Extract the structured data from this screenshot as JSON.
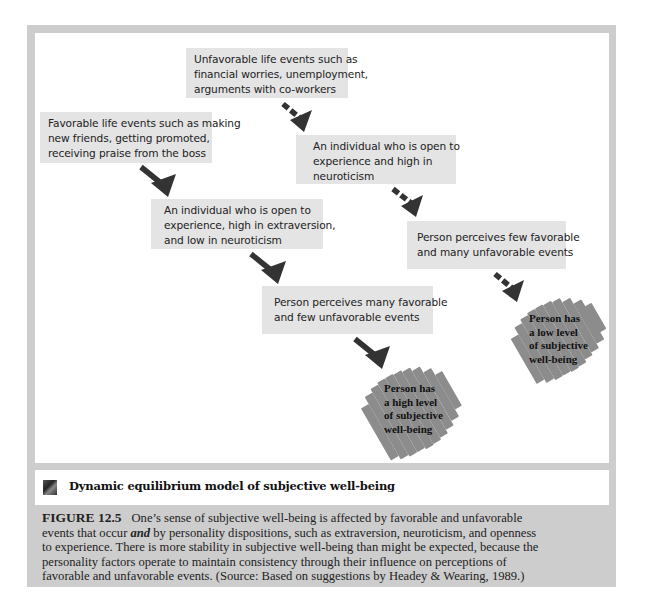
{
  "figure": {
    "title": "Dynamic equilibrium model of subjective well-being",
    "title_icon": "figure-icon",
    "caption_label": "FIGURE 12.5",
    "caption_lines": [
      "One’s sense of subjective well-being is affected by favorable and unfavorable",
      [
        "events that occur ",
        "and",
        " by personality dispositions, such as extraversion, neuroticism, and openness"
      ],
      "to experience. There is more stability in subjective well-being than might be expected, because the",
      "personality factors operate to maintain consistency through their influence on perceptions of",
      "favorable and unfavorable events.  (Source: Based on suggestions by Headey & Wearing, 1989.)"
    ],
    "caption_line2_pre": "events that occur ",
    "caption_line2_em": "and",
    "caption_line2_post": " by personality dispositions, such as extraversion, neuroticism, and openness"
  },
  "diagram": {
    "colors": {
      "box_fill": "#e4e4e4",
      "frame": "#cdcdcd",
      "arrow": "#333333",
      "splash": "#8c8c8c"
    },
    "nodes": {
      "unfavorable_events": {
        "lines": [
          "Unfavorable life events such as",
          "financial worries, unemployment,",
          "arguments with co-workers"
        ]
      },
      "favorable_events": {
        "lines": [
          "Favorable life events such as making",
          "new friends, getting promoted,",
          "receiving praise from the boss"
        ]
      },
      "open_high_neuroticism": {
        "lines": [
          "An individual who is open to",
          "experience and high in",
          "neuroticism"
        ]
      },
      "open_extraverted_low_neuroticism": {
        "lines": [
          "An individual who is open to",
          "experience, high in extraversion,",
          "and low in neuroticism"
        ]
      },
      "perceives_few_favorable": {
        "lines": [
          "Person perceives few favorable",
          "and many unfavorable events"
        ]
      },
      "perceives_many_favorable": {
        "lines": [
          "Person perceives many favorable",
          "and few unfavorable events"
        ]
      },
      "low_wellbeing": {
        "lines": [
          "Person has",
          "a low level",
          "of subjective",
          "well-being"
        ]
      },
      "high_wellbeing": {
        "lines": [
          "Person has",
          "a high level",
          "of subjective",
          "well-being"
        ]
      }
    },
    "edges": [
      {
        "from": "unfavorable_events",
        "to": "open_high_neuroticism",
        "style": "dashed"
      },
      {
        "from": "open_high_neuroticism",
        "to": "perceives_few_favorable",
        "style": "dashed"
      },
      {
        "from": "perceives_few_favorable",
        "to": "low_wellbeing",
        "style": "dashed"
      },
      {
        "from": "favorable_events",
        "to": "open_extraverted_low_neuroticism",
        "style": "solid"
      },
      {
        "from": "open_extraverted_low_neuroticism",
        "to": "perceives_many_favorable",
        "style": "solid"
      },
      {
        "from": "perceives_many_favorable",
        "to": "high_wellbeing",
        "style": "solid"
      }
    ]
  }
}
